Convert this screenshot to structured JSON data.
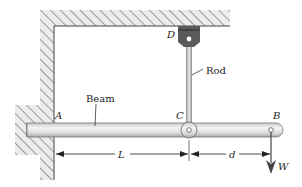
{
  "figure": {
    "type": "structural-mechanics-diagram",
    "labels": {
      "point_a": "A",
      "point_b": "B",
      "point_c": "C",
      "point_d": "D",
      "beam": "Beam",
      "rod": "Rod",
      "length_l": "L",
      "length_d": "d",
      "load_w": "W"
    },
    "colors": {
      "hatch": "#555555",
      "wall_fill": "#e6e6e6",
      "beam_fill_light": "#f2f2f2",
      "beam_fill_dark": "#b8b8b8",
      "bracket": "#5a5a5a",
      "line": "#333333"
    }
  }
}
